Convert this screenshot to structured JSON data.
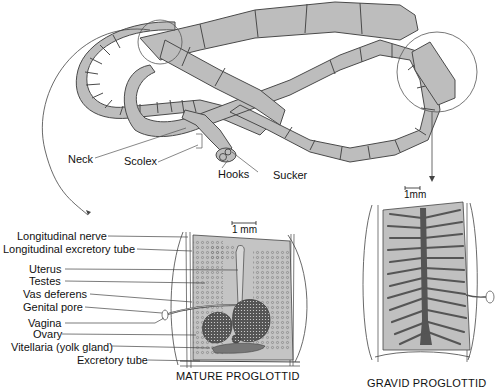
{
  "figure": {
    "colors": {
      "segment_fill": "#bdbdbd",
      "segment_stroke": "#4a4a4a",
      "tissue_fill": "#c4c4c4",
      "dark_organ": "#555555",
      "line": "#333333",
      "background": "#ffffff"
    }
  },
  "worm_labels": {
    "neck": "Neck",
    "scolex": "Scolex",
    "hooks": "Hooks",
    "sucker": "Sucker"
  },
  "mature": {
    "caption": "MATURE PROGLOTTID",
    "scale": "1 mm",
    "labels": [
      "Longitudinal nerve",
      "Longitudinal excretory tube",
      "Uterus",
      "Testes",
      "Vas deferens",
      "Genital pore",
      "Vagina",
      "Ovary",
      "Vitellaria (yolk gland)",
      "Excretory tube"
    ]
  },
  "gravid": {
    "caption": "GRAVID PROGLOTTID",
    "scale": "1mm"
  }
}
